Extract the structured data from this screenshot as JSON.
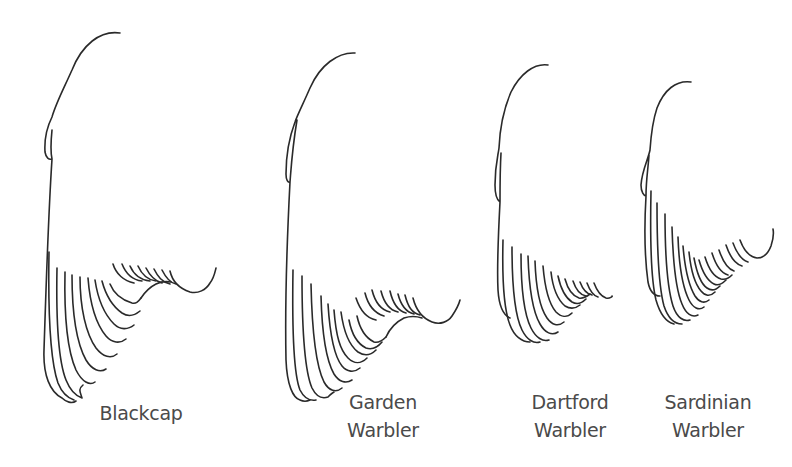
{
  "figure": {
    "stroke_color": "#2a2a2a",
    "label_color": "#4a4a4a",
    "wings": [
      {
        "id": "blackcap",
        "label_lines": [
          "Blackcap",
          ""
        ]
      },
      {
        "id": "garden-warbler",
        "label_lines": [
          "Garden",
          "Warbler"
        ]
      },
      {
        "id": "dartford-warbler",
        "label_lines": [
          "Dartford",
          "Warbler"
        ]
      },
      {
        "id": "sardinian-warbler",
        "label_lines": [
          "Sardinian",
          "Warbler"
        ]
      }
    ]
  }
}
